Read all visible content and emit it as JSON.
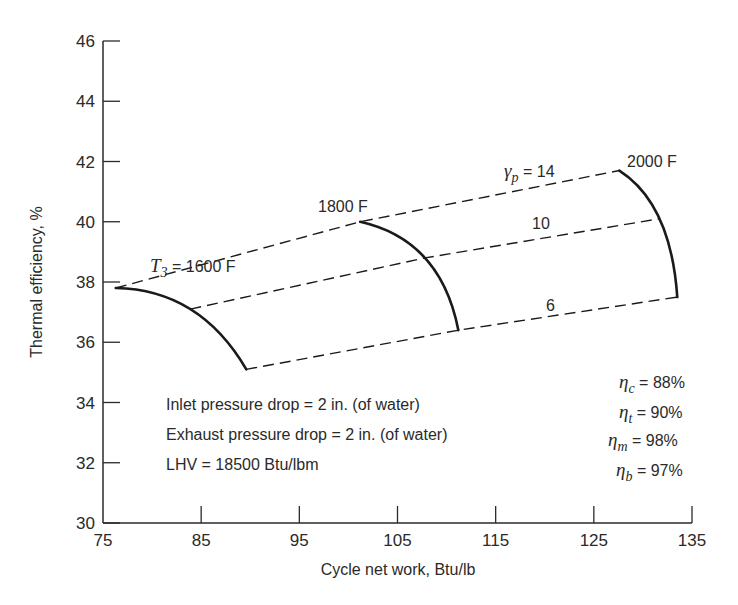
{
  "chart_data": {
    "type": "line",
    "title": "",
    "xlabel": "Cycle net work, Btu/lb",
    "ylabel": "Thermal efficiency, %",
    "xlim": [
      75,
      135
    ],
    "ylim": [
      30,
      46
    ],
    "xticks": [
      75,
      85,
      95,
      105,
      115,
      125,
      135
    ],
    "yticks": [
      30,
      32,
      34,
      36,
      38,
      40,
      42,
      44,
      46
    ],
    "grid": false,
    "legend": "none (inline labels)",
    "series": [
      {
        "name": "T3 = 1600 F",
        "style": "solid",
        "points": [
          {
            "pressure_ratio": 14,
            "x": 76.3,
            "y": 37.8
          },
          {
            "pressure_ratio": 10,
            "x": 83.9,
            "y": 37.1
          },
          {
            "pressure_ratio": 6,
            "x": 89.6,
            "y": 35.1
          }
        ]
      },
      {
        "name": "1800 F",
        "style": "solid",
        "points": [
          {
            "pressure_ratio": 14,
            "x": 101.2,
            "y": 40.0
          },
          {
            "pressure_ratio": 10,
            "x": 107.8,
            "y": 38.8
          },
          {
            "pressure_ratio": 6,
            "x": 111.2,
            "y": 36.4
          }
        ]
      },
      {
        "name": "2000 F",
        "style": "solid",
        "points": [
          {
            "pressure_ratio": 14,
            "x": 127.6,
            "y": 41.7
          },
          {
            "pressure_ratio": 10,
            "x": 131.7,
            "y": 40.1
          },
          {
            "pressure_ratio": 6,
            "x": 133.5,
            "y": 37.5
          }
        ]
      },
      {
        "name": "γp = 14",
        "style": "dashed",
        "points": [
          {
            "x": 76.3,
            "y": 37.8
          },
          {
            "x": 101.2,
            "y": 40.0
          },
          {
            "x": 127.6,
            "y": 41.7
          }
        ]
      },
      {
        "name": "10",
        "style": "dashed",
        "points": [
          {
            "x": 83.9,
            "y": 37.1
          },
          {
            "x": 107.8,
            "y": 38.8
          },
          {
            "x": 131.7,
            "y": 40.1
          }
        ]
      },
      {
        "name": "6",
        "style": "dashed",
        "points": [
          {
            "x": 89.6,
            "y": 35.1
          },
          {
            "x": 111.2,
            "y": 36.4
          },
          {
            "x": 133.5,
            "y": 37.5
          }
        ]
      }
    ],
    "annotations": [
      "T3 = 1600 F",
      "1800 F",
      "2000 F",
      "γp = 14",
      "10",
      "6",
      "Inlet pressure drop = 2 in. (of water)",
      "Exhaust pressure drop = 2 in. (of water)",
      "LHV = 18500 Btu/lbm",
      "ηc = 88%",
      "ηt = 90%",
      "ηm = 98%",
      "ηb = 97%"
    ]
  },
  "labels": {
    "t3_symbol": "T",
    "t3_sub": "3",
    "t3_rest": " = 1600 F",
    "t1800": "1800 F",
    "t2000": "2000 F",
    "rp_symbol": "γ",
    "rp_sub": "p",
    "rp14_rest": " = 14",
    "rp10": "10",
    "rp6": "6"
  },
  "conditions": [
    "Inlet pressure drop = 2 in. (of water)",
    "Exhaust pressure drop = 2 in. (of water)",
    "LHV = 18500 Btu/lbm"
  ],
  "efficiencies": [
    {
      "symbol": "η",
      "sub": "c",
      "value": " = 88%"
    },
    {
      "symbol": "η",
      "sub": "t",
      "value": " = 90%"
    },
    {
      "symbol": "η",
      "sub": "m",
      "value": " = 98%"
    },
    {
      "symbol": "η",
      "sub": "b",
      "value": " = 97%"
    }
  ],
  "colors": {
    "line": "#1a1a1a",
    "text": "#2a2a2a",
    "background": "#ffffff"
  }
}
